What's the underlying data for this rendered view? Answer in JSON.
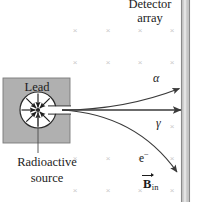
{
  "figure": {
    "width": 197,
    "height": 202,
    "background": "#ffffff"
  },
  "colors": {
    "lead_block_fill": "#b0b0b0",
    "lead_block_stroke": "#6e6e6e",
    "cavity_fill": "#ffffff",
    "cavity_stroke": "#2b2b2b",
    "detector_fill": "#c6c6c6",
    "detector_edge": "#8a8a8a",
    "trajectory": "#3a3a3a",
    "field_mark": "#c9c9c9",
    "text": "#1c1c1c"
  },
  "labels": {
    "detector_line1": "Detector",
    "detector_line2": "array",
    "lead": "Lead",
    "source_line1": "Radioactive",
    "source_line2": "source",
    "alpha": "α",
    "gamma": "γ",
    "electron": "e",
    "electron_charge": "−",
    "bfield_symbol": "B",
    "bfield_subscript": "in"
  },
  "field": {
    "symbol": "×",
    "columns_x": [
      75,
      108,
      140,
      172
    ],
    "rows_y": [
      30,
      62,
      94,
      126,
      158,
      190
    ],
    "suppressed": [
      [
        75,
        94
      ],
      [
        75,
        126
      ],
      [
        108,
        126
      ],
      [
        140,
        126
      ],
      [
        108,
        94
      ],
      [
        140,
        94
      ],
      [
        172,
        94
      ]
    ]
  },
  "geometry": {
    "lead_block": {
      "x": 3,
      "y": 78,
      "w": 67,
      "h": 65
    },
    "cavity": {
      "cx": 38,
      "cy": 110,
      "r": 18
    },
    "collimator": {
      "x1": 38,
      "y1": 110,
      "x2": 70,
      "y2": 110
    },
    "source_point": {
      "x": 38,
      "y": 110
    },
    "detector_bar": {
      "x": 181,
      "y": 0,
      "w": 9,
      "h": 202
    },
    "pointer_line": {
      "x1": 38,
      "y1": 110,
      "x2": 38,
      "y2": 153
    }
  },
  "trajectories": [
    {
      "particle": "alpha",
      "label": "α",
      "charge": "positive",
      "deflection": "upward",
      "path": "M 62 110 C 105 110, 140 102, 182 87",
      "arrow_at": {
        "x": 182,
        "y": 87,
        "angle": -22
      }
    },
    {
      "particle": "gamma",
      "label": "γ",
      "charge": "neutral",
      "deflection": "none",
      "path": "M 62 110 L 184 110",
      "arrow_at": {
        "x": 184,
        "y": 110,
        "angle": 0
      }
    },
    {
      "particle": "electron",
      "label": "e−",
      "charge": "negative",
      "deflection": "downward",
      "path": "M 62 110 C 110 112, 150 132, 180 175",
      "arrow_at": {
        "x": 180,
        "y": 175,
        "angle": 57
      }
    }
  ],
  "cavity_arrows": [
    {
      "angle": 180
    },
    {
      "angle": 135
    },
    {
      "angle": 90
    },
    {
      "angle": 45
    },
    {
      "angle": 225
    },
    {
      "angle": 270
    },
    {
      "angle": 315
    }
  ]
}
